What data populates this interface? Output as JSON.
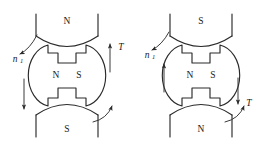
{
  "figure": {
    "title": "",
    "type": "physics-diagram"
  },
  "diagrams": [
    {
      "id": "left",
      "stator": {
        "top_pole_label": "N",
        "bottom_pole_label": "S"
      },
      "rotor": {
        "left_pole_label": "N",
        "right_pole_label": "S"
      },
      "annotations": {
        "speed_label": "n",
        "speed_subscript": "1",
        "torque_label": "T",
        "torque_arrow_direction": "up",
        "side_arrow_direction": "down",
        "curved_arrow_direction": "counterclockwise"
      }
    },
    {
      "id": "right",
      "stator": {
        "top_pole_label": "S",
        "bottom_pole_label": "N"
      },
      "rotor": {
        "left_pole_label": "N",
        "right_pole_label": "S"
      },
      "annotations": {
        "speed_label": "n",
        "speed_subscript": "1",
        "torque_label": "T",
        "torque_arrow_direction": "down",
        "side_arrow_direction": "up",
        "curved_arrow_direction": "counterclockwise"
      }
    }
  ],
  "colors": {
    "ink": "#2b2b2b",
    "background": "#ffffff"
  }
}
